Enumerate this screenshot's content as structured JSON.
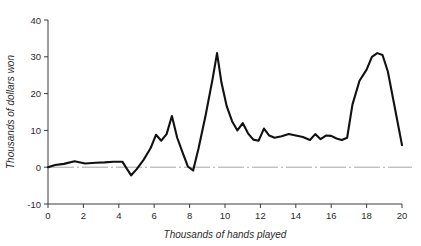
{
  "chart_data": {
    "type": "line",
    "title": "",
    "xlabel": "Thousands of hands played",
    "ylabel": "Thousands of dollars won",
    "xlim": [
      0,
      20
    ],
    "ylim": [
      -10,
      40
    ],
    "xticks": [
      0,
      2,
      4,
      6,
      8,
      10,
      12,
      14,
      16,
      18,
      20
    ],
    "yticks": [
      -10,
      0,
      10,
      20,
      30,
      40
    ],
    "xtick_labels": [
      "0",
      "2",
      "4",
      "6",
      "8",
      "10",
      "12",
      "14",
      "16",
      "18",
      "20"
    ],
    "ytick_labels": [
      "-10",
      "0",
      "10",
      "20",
      "30",
      "40"
    ],
    "grid": false,
    "legend": false,
    "reference_lines": [
      {
        "name": "zero-line",
        "axis": "y",
        "value": 0,
        "style": "dash-dot",
        "color": "#9a9a9a"
      }
    ],
    "series": [
      {
        "name": "cumulative-winnings",
        "color": "#111111",
        "x": [
          0.0,
          0.4,
          0.9,
          1.5,
          2.1,
          2.7,
          3.2,
          3.7,
          4.2,
          4.45,
          4.7,
          5.0,
          5.4,
          5.8,
          6.1,
          6.4,
          6.7,
          7.0,
          7.3,
          7.6,
          7.9,
          8.2,
          8.5,
          8.9,
          9.3,
          9.55,
          9.8,
          10.1,
          10.4,
          10.7,
          11.0,
          11.3,
          11.6,
          11.9,
          12.2,
          12.5,
          12.8,
          13.2,
          13.6,
          14.0,
          14.4,
          14.8,
          15.1,
          15.4,
          15.7,
          16.0,
          16.3,
          16.6,
          16.9,
          17.2,
          17.6,
          18.0,
          18.3,
          18.6,
          18.9,
          19.2,
          19.6,
          20.0
        ],
        "y": [
          0.0,
          0.6,
          0.9,
          1.6,
          1.0,
          1.2,
          1.3,
          1.5,
          1.5,
          -0.4,
          -2.2,
          -0.6,
          2.0,
          5.2,
          8.8,
          7.2,
          9.0,
          13.9,
          8.0,
          4.0,
          0.2,
          -0.9,
          5.0,
          14.0,
          24.0,
          31.0,
          23.0,
          16.5,
          12.5,
          10.0,
          12.0,
          9.2,
          7.5,
          7.2,
          10.5,
          8.6,
          8.0,
          8.4,
          9.0,
          8.6,
          8.2,
          7.4,
          9.0,
          7.6,
          8.6,
          8.5,
          7.8,
          7.4,
          8.0,
          17.0,
          23.5,
          26.5,
          30.0,
          31.0,
          30.5,
          26.0,
          16.0,
          6.0
        ]
      }
    ]
  }
}
